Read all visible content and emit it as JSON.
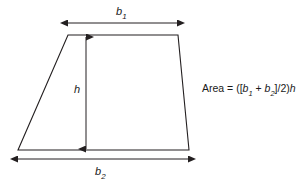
{
  "figure": {
    "type": "geometry-diagram",
    "shape": "trapezoid",
    "labels": {
      "top_base": {
        "base": "b",
        "subscript": "1",
        "full": "b1"
      },
      "bottom_base": {
        "base": "b",
        "subscript": "2",
        "full": "b2"
      },
      "height": {
        "base": "h",
        "full": "h"
      }
    },
    "formula": {
      "lead": "Area = ([",
      "b_symbol": "b",
      "sub1": "1",
      "plus": " + ",
      "sub2": "2",
      "tail": "]/2)",
      "h_symbol": "h",
      "full_text": "Area = ([b1 + b2]/2)h"
    },
    "colors": {
      "stroke": "#231f20",
      "text": "#1a1a1a",
      "background": "#ffffff"
    },
    "geometry": {
      "top_left": [
        68,
        35
      ],
      "top_right": [
        178,
        35
      ],
      "bottom_right": [
        189,
        150
      ],
      "bottom_left": [
        18,
        150
      ],
      "top_dimension_line": {
        "x1": 68,
        "x2": 177,
        "y": 23
      },
      "bottom_dimension_line": {
        "x1": 18,
        "x2": 188,
        "y": 159
      },
      "height_dimension_line": {
        "x": 86,
        "y1": 36,
        "y2": 150
      }
    }
  }
}
